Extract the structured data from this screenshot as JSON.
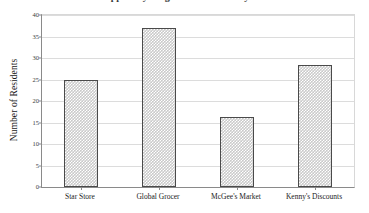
{
  "chart_data": {
    "type": "bar",
    "title": "Shoppers by Neighborhood Grocery Store",
    "xlabel": "",
    "ylabel": "Number of Residents",
    "categories": [
      "Star Store",
      "Global Grocer",
      "McGee's Market",
      "Kenny's Discounts"
    ],
    "values": [
      25,
      37,
      16.3,
      28.3
    ],
    "ylim": [
      0,
      40
    ],
    "yticks": [
      0,
      5,
      10,
      15,
      20,
      25,
      30,
      35,
      40
    ],
    "ytick_labels": [
      "0",
      "5",
      "10",
      "15",
      "20",
      "25",
      "30",
      "35",
      "40"
    ],
    "grid": true,
    "legend": false,
    "bar_fill": "#c9c9c9",
    "bar_border": "#4a4a4a",
    "gridline_color": "#dcdcdc",
    "axis_color": "#8a8a8a",
    "background": "#ffffff"
  }
}
